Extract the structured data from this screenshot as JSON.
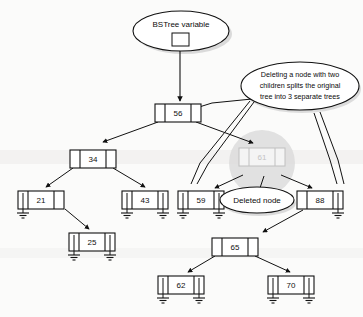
{
  "diagram": {
    "background_color": "#fbfbfa",
    "line_color": "#111111",
    "node_fill": "#ffffff",
    "deleted_color": "#c3c3c3",
    "shadow_color": "#d9d9d9"
  },
  "callouts": [
    {
      "id": "bstree-variable",
      "text": "BSTree variable",
      "shape": "ellipse"
    },
    {
      "id": "split-explanation",
      "shape": "ellipse",
      "lines": [
        "Deleting a node with two",
        "children splits the original",
        "tree into 3 separate trees"
      ]
    },
    {
      "id": "deleted-node",
      "text": "Deleted node",
      "shape": "ellipse"
    }
  ],
  "tree": {
    "root_value": "56",
    "nodes": [
      {
        "id": "n56",
        "value": "56",
        "state": "normal",
        "left_null": false,
        "right_null": false
      },
      {
        "id": "n34",
        "value": "34",
        "state": "normal",
        "left_null": false,
        "right_null": false
      },
      {
        "id": "n61",
        "value": "61",
        "state": "deleted",
        "left_null": false,
        "right_null": false
      },
      {
        "id": "n21",
        "value": "21",
        "state": "normal",
        "left_null": true,
        "right_null": false
      },
      {
        "id": "n43",
        "value": "43",
        "state": "normal",
        "left_null": true,
        "right_null": true
      },
      {
        "id": "n59",
        "value": "59",
        "state": "normal",
        "left_null": true,
        "right_null": true
      },
      {
        "id": "n88",
        "value": "88",
        "state": "normal",
        "left_null": false,
        "right_null": true
      },
      {
        "id": "n25",
        "value": "25",
        "state": "normal",
        "left_null": true,
        "right_null": true
      },
      {
        "id": "n65",
        "value": "65",
        "state": "normal",
        "left_null": false,
        "right_null": false
      },
      {
        "id": "n62",
        "value": "62",
        "state": "normal",
        "left_null": true,
        "right_null": true
      },
      {
        "id": "n70",
        "value": "70",
        "state": "normal",
        "left_null": true,
        "right_null": true
      }
    ]
  }
}
